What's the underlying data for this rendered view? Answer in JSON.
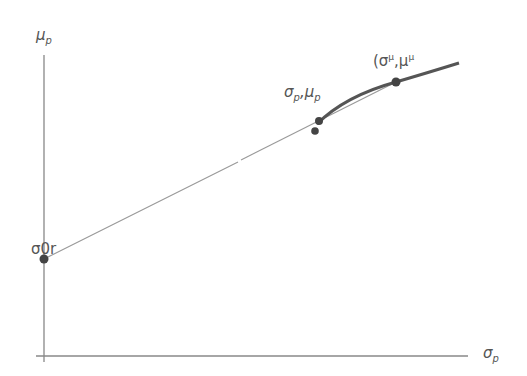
{
  "diagram": {
    "type": "capital-market-line",
    "axes": {
      "y_label": "μ",
      "y_label_sub": "p",
      "x_label": "σ",
      "x_label_sub": "p"
    },
    "points": {
      "risk_free": {
        "label_main": "σ0",
        "label_sep": ", ",
        "label_tail": "r"
      },
      "portfolio": {
        "label_main": "σ",
        "label_main_sub": "p",
        "label_sep": ",",
        "label_second": "μ",
        "label_second_sub": "p"
      },
      "tangency": {
        "label_open": "(σ",
        "label_sup1": "μ",
        "label_sep": ",μ",
        "label_sup2": "μ"
      }
    },
    "colors": {
      "axis": "#777777",
      "line": "#888888",
      "curve": "#555555",
      "point": "#444444",
      "text": "#555555"
    }
  }
}
